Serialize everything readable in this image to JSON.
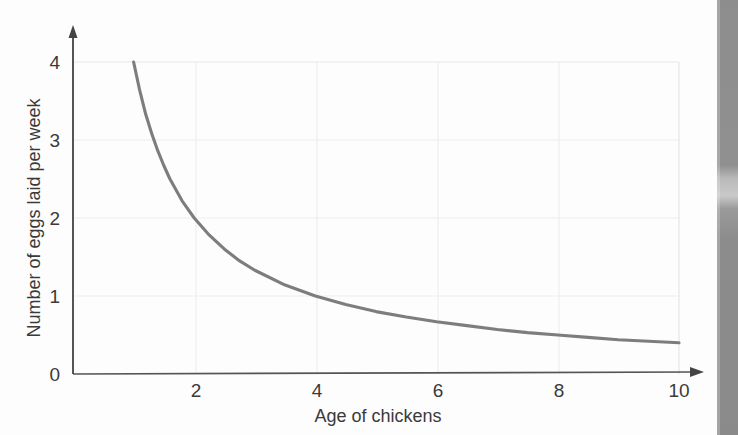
{
  "chart_data": {
    "type": "line",
    "title": "",
    "subtitle": "",
    "xlabel": "Age of chickens",
    "ylabel": "Number of eggs laid per week",
    "xlim": [
      0,
      10.6
    ],
    "ylim": [
      0,
      4.4
    ],
    "xticks": [
      2,
      4,
      6,
      8,
      10
    ],
    "xtick_labels": [
      "2",
      "4",
      "6",
      "8",
      "10"
    ],
    "yticks": [
      0,
      1,
      2,
      3,
      4
    ],
    "ytick_labels": [
      "0",
      "1",
      "2",
      "3",
      "4"
    ],
    "grid": true,
    "grid_color": "#ececec",
    "legend": null,
    "annotations": [],
    "series": [
      {
        "name": "eggs per week",
        "relationship": "y = 4 / x",
        "color": "#7d7d7d",
        "line_width": 3,
        "x": [
          1.0,
          1.1,
          1.2,
          1.3,
          1.4,
          1.5,
          1.6,
          1.8,
          2.0,
          2.25,
          2.5,
          2.75,
          3.0,
          3.5,
          4.0,
          4.5,
          5.0,
          5.5,
          6.0,
          6.5,
          7.0,
          7.5,
          8.0,
          8.5,
          9.0,
          9.5,
          10.0
        ],
        "values": [
          4.0,
          3.64,
          3.33,
          3.08,
          2.86,
          2.67,
          2.5,
          2.22,
          2.0,
          1.78,
          1.6,
          1.45,
          1.33,
          1.14,
          1.0,
          0.89,
          0.8,
          0.73,
          0.67,
          0.62,
          0.57,
          0.53,
          0.5,
          0.47,
          0.44,
          0.42,
          0.4
        ]
      }
    ],
    "key_points": [
      {
        "x": 1,
        "y": 4
      },
      {
        "x": 2,
        "y": 2
      },
      {
        "x": 4,
        "y": 1
      },
      {
        "x": 8,
        "y": 0.5
      },
      {
        "x": 10,
        "y": 0.4
      }
    ]
  },
  "axes": {
    "x_arrow": true,
    "y_arrow": true,
    "axis_color": "#555555"
  },
  "scan": {
    "edge_label": "page-edge-shadow"
  }
}
